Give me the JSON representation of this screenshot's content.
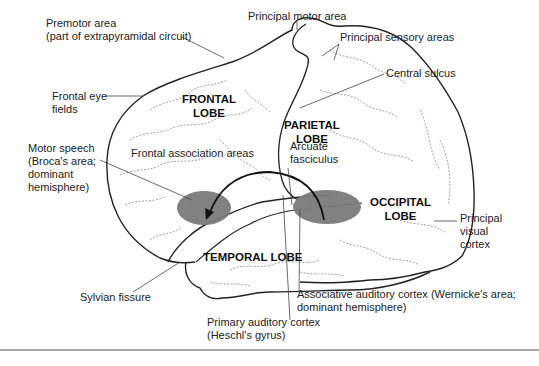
{
  "diagram": {
    "type": "brain-lateral-view",
    "lobes": [
      {
        "id": "frontal",
        "lines": [
          "FRONTAL",
          "LOBE"
        ]
      },
      {
        "id": "parietal",
        "lines": [
          "PARIETAL",
          "LOBE"
        ]
      },
      {
        "id": "occipital",
        "lines": [
          "OCCIPITAL",
          "LOBE"
        ]
      },
      {
        "id": "temporal",
        "lines": [
          "TEMPORAL LOBE"
        ]
      }
    ],
    "labels": {
      "premotor": [
        "Premotor area",
        "(part of extrapyramidal circuit)"
      ],
      "principal_motor": [
        "Principal motor area"
      ],
      "principal_sensory": [
        "Principal sensory areas"
      ],
      "central_sulcus": [
        "Central sulcus"
      ],
      "frontal_eye": [
        "Frontal eye",
        "fields"
      ],
      "motor_speech": [
        "Motor speech",
        "(Broca's area;",
        "dominant",
        "hemisphere)"
      ],
      "frontal_association": [
        "Frontal association areas"
      ],
      "arcuate": [
        "Arcuate",
        "fasciculus"
      ],
      "visual_cortex": [
        "Principal",
        "visual",
        "cortex"
      ],
      "sylvian": [
        "Sylvian fissure"
      ],
      "wernicke": [
        "Associative auditory cortex (Wernicke's area;",
        "dominant hemisphere)"
      ],
      "primary_auditory": [
        "Primary auditory cortex",
        "(Heschl's gyrus)"
      ]
    },
    "highlight_regions": [
      {
        "name": "Broca's area",
        "color": "#7a7a7a"
      },
      {
        "name": "Wernicke's area",
        "color": "#7a7a7a"
      }
    ],
    "colors": {
      "outline": "#222222",
      "sulci": "#888888",
      "highlight": "#7a7a7a",
      "background": "#ffffff"
    }
  }
}
